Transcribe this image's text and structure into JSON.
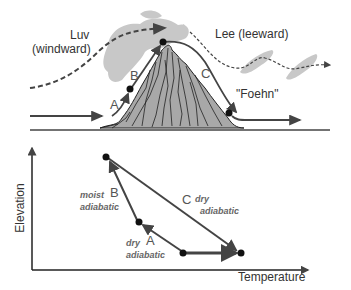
{
  "top_panel": {
    "windward_label_line1": "Luv",
    "windward_label_line2": "(windward)",
    "leeward_label": "Lee (leeward)",
    "foehn_label": "\"Foehn\"",
    "segment_labels": {
      "a": "A",
      "b": "B",
      "c": "C"
    }
  },
  "bottom_panel": {
    "y_axis_label": "Elevation",
    "x_axis_label": "Temperature",
    "segments": [
      {
        "letter": "A",
        "process_line1": "dry",
        "process_line2": "adiabatic"
      },
      {
        "letter": "B",
        "process_line1": "moist",
        "process_line2": "adiabatic"
      },
      {
        "letter": "C",
        "process_line1": "dry",
        "process_line2": "adiabatic"
      }
    ]
  },
  "colors": {
    "line": "#444444",
    "mountain_fill": "#a8a8a8",
    "cloud": "#c8c8c8",
    "text": "#333333",
    "process_text": "#666666"
  }
}
